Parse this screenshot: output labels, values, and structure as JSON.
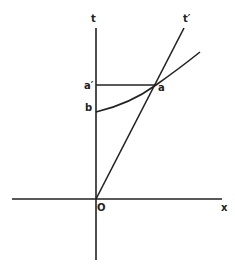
{
  "diagram": {
    "type": "spacetime-diagram",
    "labels": {
      "t_axis": "t",
      "t_prime_axis": "t′",
      "x_axis": "x",
      "origin": "O",
      "point_a": "a",
      "point_a_prime": "a′",
      "point_b": "b"
    },
    "colors": {
      "ink": "#222222",
      "background": "#ffffff"
    }
  }
}
